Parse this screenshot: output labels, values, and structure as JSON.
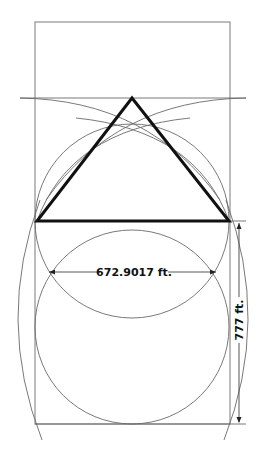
{
  "diagram": {
    "type": "geometric construction",
    "elements": [
      "rectangle",
      "equilateral-ish triangle",
      "circles",
      "construction arcs",
      "dimension lines"
    ],
    "dimensions": {
      "width_label": "672.9017 ft.",
      "height_label": "777 ft."
    },
    "colors": {
      "triangle": "#111111",
      "construction_lines": "#6a6a6a",
      "background": "#ffffff"
    }
  }
}
